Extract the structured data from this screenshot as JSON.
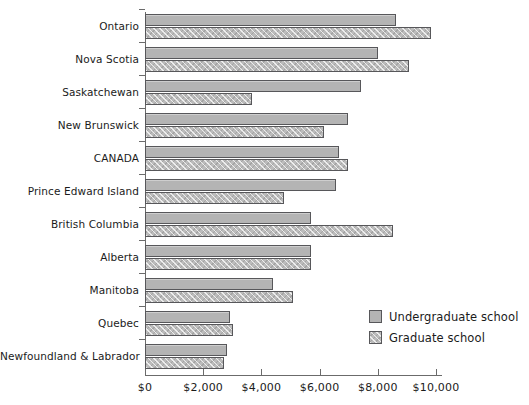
{
  "chart_data": {
    "type": "bar",
    "orientation": "horizontal",
    "title": "",
    "subtitle": "",
    "xlabel": "",
    "ylabel": "",
    "xlim": [
      0,
      10500
    ],
    "xticks": [
      0,
      2000,
      4000,
      6000,
      8000,
      10000
    ],
    "xticklabels": [
      "$0",
      "$2,000",
      "$4,000",
      "$6,000",
      "$8,000",
      "$10,000"
    ],
    "grid": false,
    "legend_position": "bottom-right",
    "categories": [
      "Ontario",
      "Nova Scotia",
      "Saskatchewan",
      "New Brunswick",
      "CANADA",
      "Prince Edward Island",
      "British Columbia",
      "Alberta",
      "Manitoba",
      "Quebec",
      "Newfoundland & Labrador"
    ],
    "series": [
      {
        "name": "Undergraduate school",
        "key": "under",
        "color": "#b4b4b4",
        "values": [
          8620,
          8000,
          7410,
          6960,
          6660,
          6550,
          5690,
          5690,
          4410,
          2930,
          2830
        ]
      },
      {
        "name": "Graduate school",
        "key": "grad",
        "color": "#bcbcbc",
        "values": [
          9830,
          9070,
          3690,
          6140,
          6960,
          4760,
          8520,
          5690,
          5070,
          3030,
          2720
        ]
      }
    ]
  },
  "legend": {
    "items": [
      {
        "label": "Undergraduate school",
        "swatch": "under"
      },
      {
        "label": "Graduate school",
        "swatch": "grad"
      }
    ]
  }
}
